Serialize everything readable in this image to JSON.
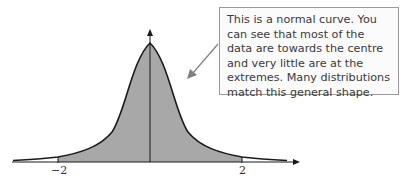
{
  "callout": {
    "text": "This is a normal curve. You can see that most of the data are towards the centre and very little are at the extremes. Many distributions match this general shape."
  },
  "axis": {
    "ticks": [
      {
        "label": "−2",
        "value": -2
      },
      {
        "label": "2",
        "value": 2
      }
    ]
  },
  "colors": {
    "fill": "#a8a8a8",
    "curve": "#1a1a1a",
    "callout_border": "#9a9a9a",
    "arrow": "#808080"
  }
}
